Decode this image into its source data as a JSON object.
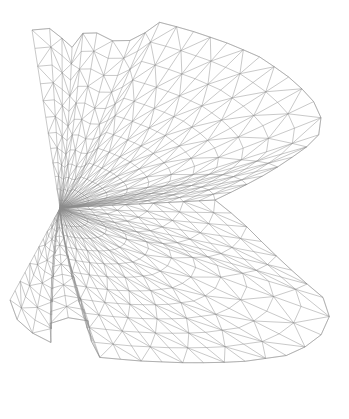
{
  "figure": {
    "kind": "wireframe-triangulated-surface",
    "width": 349,
    "height": 419,
    "background": "#ffffff",
    "line_color": "#8a8a8a",
    "line_width": 0.55,
    "line_opacity": 0.85
  },
  "sheets": [
    {
      "name": "upper-sheet",
      "rows": 12,
      "cols": 14,
      "pinch": [
        60,
        208
      ],
      "outer_edge": [
        [
          32,
          30
        ],
        [
          55,
          28
        ],
        [
          70,
          50
        ],
        [
          87,
          28
        ],
        [
          115,
          42
        ],
        [
          135,
          40
        ],
        [
          160,
          22
        ],
        [
          195,
          32
        ],
        [
          230,
          44
        ],
        [
          262,
          58
        ],
        [
          290,
          78
        ],
        [
          312,
          98
        ],
        [
          322,
          120
        ],
        [
          318,
          138
        ],
        [
          300,
          152
        ],
        [
          270,
          172
        ],
        [
          240,
          188
        ],
        [
          215,
          200
        ]
      ],
      "left_edge_bend": [
        [
          12,
          100
        ],
        [
          20,
          155
        ],
        [
          35,
          185
        ]
      ]
    },
    {
      "name": "lower-sheet",
      "rows": 12,
      "cols": 14,
      "pinch": [
        60,
        208
      ],
      "outer_edge": [
        [
          10,
          300
        ],
        [
          18,
          322
        ],
        [
          35,
          335
        ],
        [
          52,
          343
        ],
        [
          50,
          322
        ],
        [
          62,
          317
        ],
        [
          88,
          320
        ],
        [
          92,
          345
        ],
        [
          95,
          357
        ],
        [
          140,
          361
        ],
        [
          190,
          363
        ],
        [
          240,
          362
        ],
        [
          290,
          355
        ],
        [
          318,
          340
        ],
        [
          330,
          320
        ],
        [
          326,
          300
        ],
        [
          300,
          278
        ],
        [
          270,
          250
        ],
        [
          240,
          220
        ],
        [
          215,
          200
        ]
      ]
    }
  ]
}
